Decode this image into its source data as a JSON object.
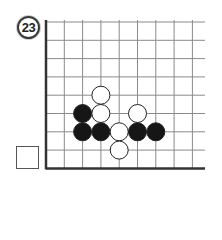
{
  "problem": {
    "number": "23"
  },
  "board": {
    "origin_x": 46,
    "origin_y": 22,
    "spacing": 18.3,
    "cols_visible": 9,
    "rows_visible": 8,
    "extend_right_to": 205,
    "line_color": "#8a8a8a",
    "edge_color": "#333333",
    "edges": [
      "left",
      "bottom"
    ],
    "stone_radius": 9,
    "stones": [
      {
        "color": "white",
        "col": 3,
        "row": 4
      },
      {
        "color": "black",
        "col": 2,
        "row": 5
      },
      {
        "color": "white",
        "col": 3,
        "row": 5
      },
      {
        "color": "white",
        "col": 5,
        "row": 5
      },
      {
        "color": "black",
        "col": 2,
        "row": 6
      },
      {
        "color": "black",
        "col": 3,
        "row": 6
      },
      {
        "color": "white",
        "col": 4,
        "row": 6
      },
      {
        "color": "black",
        "col": 5,
        "row": 6
      },
      {
        "color": "black",
        "col": 6,
        "row": 6
      },
      {
        "color": "white",
        "col": 4,
        "row": 7
      }
    ]
  },
  "answer_box": {
    "value": ""
  }
}
